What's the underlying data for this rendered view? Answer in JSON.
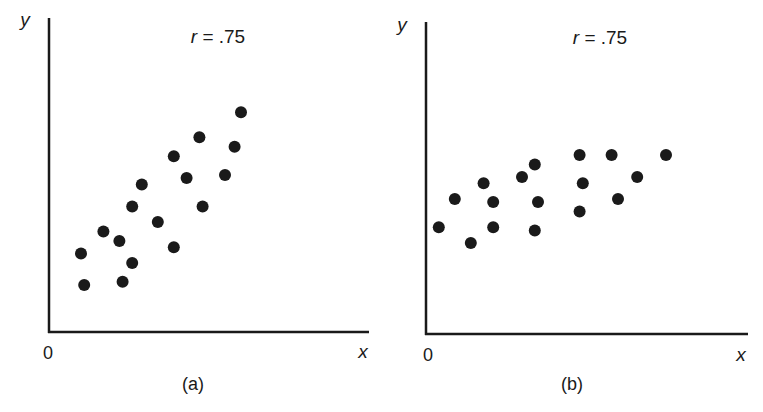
{
  "chart_data": [
    {
      "type": "scatter",
      "panel_label": "(a)",
      "annotation": "r = .75",
      "annotation_parts": {
        "var": "r",
        "rest": " = .75"
      },
      "xlabel": "x",
      "ylabel": "y",
      "origin_label": "0",
      "grid": false,
      "legend": null,
      "axis_ticks": "none",
      "xlim": [
        0,
        10
      ],
      "ylim": [
        0,
        10
      ],
      "points": [
        {
          "x": 1.0,
          "y": 2.5
        },
        {
          "x": 1.1,
          "y": 1.5
        },
        {
          "x": 1.7,
          "y": 3.2
        },
        {
          "x": 2.2,
          "y": 2.9
        },
        {
          "x": 2.3,
          "y": 1.6
        },
        {
          "x": 2.6,
          "y": 2.2
        },
        {
          "x": 2.6,
          "y": 4.0
        },
        {
          "x": 2.9,
          "y": 4.7
        },
        {
          "x": 3.4,
          "y": 3.5
        },
        {
          "x": 3.9,
          "y": 2.7
        },
        {
          "x": 3.9,
          "y": 5.6
        },
        {
          "x": 4.3,
          "y": 4.9
        },
        {
          "x": 4.7,
          "y": 6.2
        },
        {
          "x": 4.8,
          "y": 4.0
        },
        {
          "x": 5.5,
          "y": 5.0
        },
        {
          "x": 5.8,
          "y": 5.9
        },
        {
          "x": 6.0,
          "y": 7.0
        }
      ]
    },
    {
      "type": "scatter",
      "panel_label": "(b)",
      "annotation": "r = .75",
      "annotation_parts": {
        "var": "r",
        "rest": " = .75"
      },
      "xlabel": "x",
      "ylabel": "y",
      "origin_label": "0",
      "grid": false,
      "legend": null,
      "axis_ticks": "none",
      "xlim": [
        0,
        10
      ],
      "ylim": [
        0,
        10
      ],
      "points": [
        {
          "x": 0.4,
          "y": 3.4
        },
        {
          "x": 0.9,
          "y": 4.3
        },
        {
          "x": 1.4,
          "y": 2.9
        },
        {
          "x": 1.8,
          "y": 4.8
        },
        {
          "x": 2.1,
          "y": 4.2
        },
        {
          "x": 2.1,
          "y": 3.4
        },
        {
          "x": 3.0,
          "y": 5.0
        },
        {
          "x": 3.4,
          "y": 5.4
        },
        {
          "x": 3.5,
          "y": 4.2
        },
        {
          "x": 3.4,
          "y": 3.3
        },
        {
          "x": 4.8,
          "y": 5.7
        },
        {
          "x": 4.9,
          "y": 4.8
        },
        {
          "x": 4.8,
          "y": 3.9
        },
        {
          "x": 5.8,
          "y": 5.7
        },
        {
          "x": 6.0,
          "y": 4.3
        },
        {
          "x": 6.6,
          "y": 5.0
        },
        {
          "x": 7.5,
          "y": 5.7
        }
      ]
    }
  ],
  "panels": [
    {
      "geom": {
        "ox": 49,
        "oy": 332,
        "top": 18,
        "right": 369,
        "px_per_unit_x": 32,
        "px_per_unit_y": 31.4
      },
      "label_pos": {
        "y": [
          25,
          26
        ],
        "r": [
          218,
          43
        ],
        "zero": [
          48,
          359
        ],
        "x": [
          363,
          358
        ],
        "panel": [
          193,
          390
        ]
      }
    },
    {
      "geom": {
        "ox": 426,
        "oy": 334,
        "top": 22,
        "right": 748,
        "px_per_unit_x": 32,
        "px_per_unit_y": 31.4
      },
      "label_pos": {
        "y": [
          402,
          31
        ],
        "r": [
          600,
          44
        ],
        "zero": [
          428,
          361
        ],
        "x": [
          741,
          361
        ],
        "panel": [
          572,
          390
        ]
      }
    }
  ],
  "style": {
    "ink": "#1a1a1a",
    "dot_radius": 6,
    "axis_width": 2.5
  }
}
